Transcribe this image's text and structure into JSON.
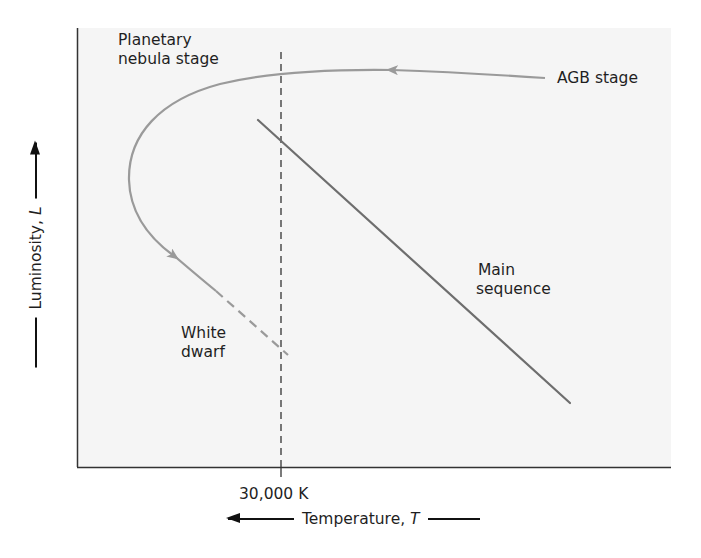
{
  "diagram": {
    "labels": {
      "planetary_nebula_line1": "Planetary",
      "planetary_nebula_line2": "nebula stage",
      "agb": "AGB stage",
      "main_sequence_line1": "Main",
      "main_sequence_line2": "sequence",
      "white_dwarf_line1": "White",
      "white_dwarf_line2": "dwarf"
    },
    "x_axis": {
      "title": "Temperature,",
      "variable": "T",
      "direction": "increasing to the left",
      "tick_label": "30,000 K"
    },
    "y_axis": {
      "title": "Luminosity,",
      "variable": "L",
      "direction": "increasing upward"
    },
    "colors": {
      "background": "#ffffff",
      "plot_area": "#f5f5f5",
      "axes": "#333333",
      "evolution_track": "#9a9a9a",
      "main_sequence": "#6e6e6e",
      "reference_line": "#333333",
      "text": "#1f1f1f"
    },
    "elements": [
      {
        "name": "evolutionary-track",
        "style": "solid gray curve with arrows",
        "from": "AGB stage",
        "through": "Planetary nebula stage",
        "to": "White dwarf"
      },
      {
        "name": "white-dwarf-extension",
        "style": "dashed gray line"
      },
      {
        "name": "main-sequence",
        "style": "solid dark gray diagonal line"
      },
      {
        "name": "30000K-reference",
        "style": "dashed vertical black line"
      }
    ]
  }
}
